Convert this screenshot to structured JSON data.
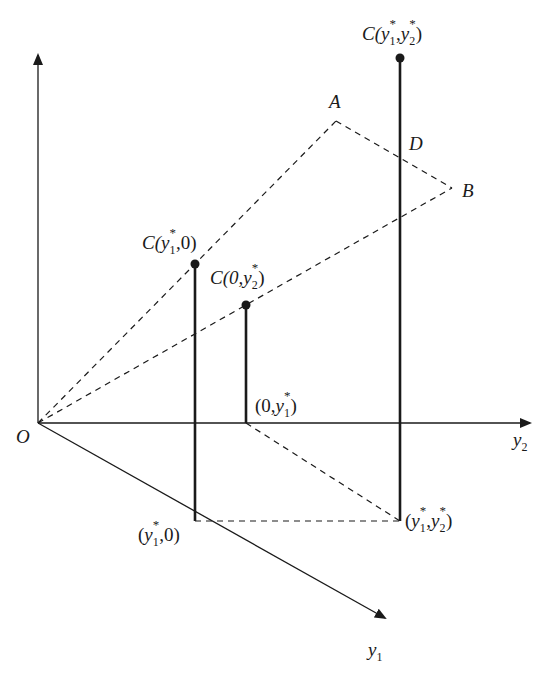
{
  "diagram": {
    "title": "",
    "colors": {
      "stroke": "#1a1a1a",
      "background": "#ffffff"
    },
    "axes": {
      "vertical": {
        "label": ""
      },
      "y2": {
        "label_base": "y",
        "label_sub": "2"
      },
      "y1": {
        "label_base": "y",
        "label_sub": "1"
      },
      "origin": {
        "label": "O"
      }
    },
    "points": {
      "A": {
        "label": "A"
      },
      "B": {
        "label": "B"
      },
      "D": {
        "label": "D"
      }
    },
    "labels": {
      "c_y1star_y2star": {
        "prefix": "C(",
        "v1": "y",
        "s1": "1",
        "star1": "*",
        "sep": ",",
        "v2": "y",
        "s2": "2",
        "star2": "*",
        "suffix": ")"
      },
      "c_y1star_0": {
        "prefix": "C(",
        "v1": "y",
        "s1": "1",
        "star1": "*",
        "rest": ",0)"
      },
      "c_0_y2star": {
        "prefix": "C(0,",
        "v2": "y",
        "s2": "2",
        "star2": "*",
        "suffix": ")"
      },
      "pt_0_y1star": {
        "prefix": "(0,",
        "v": "y",
        "s": "1",
        "star": "*",
        "suffix": ")"
      },
      "pt_y1star_0": {
        "prefix": "(",
        "v": "y",
        "s": "1",
        "star": "*",
        "rest": ",0)"
      },
      "pt_y1star_y2star": {
        "prefix": "(",
        "v1": "y",
        "s1": "1",
        "star1": "*",
        "sep": ",",
        "v2": "y",
        "s2": "2",
        "star2": "*",
        "suffix": ")"
      }
    }
  }
}
